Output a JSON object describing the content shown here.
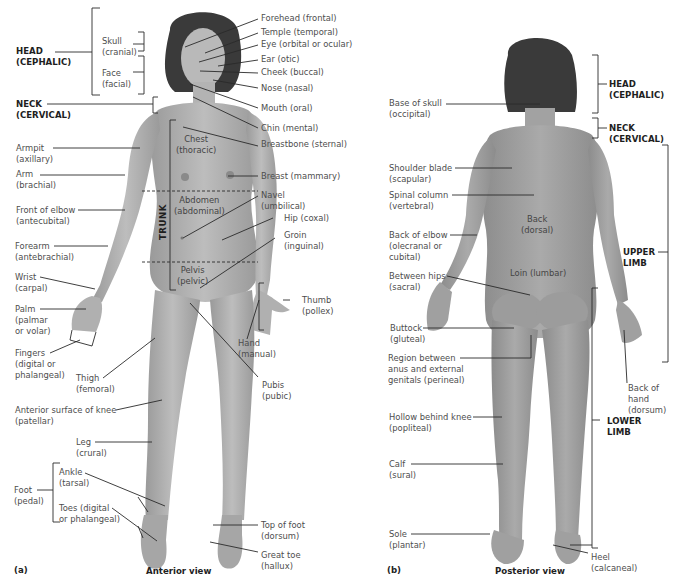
{
  "anterior": {
    "panel_label": "(a)",
    "view_title": "Anterior view",
    "regions": {
      "head": [
        "HEAD",
        "(CEPHALIC)"
      ],
      "neck": [
        "NECK",
        "(CERVICAL)"
      ],
      "trunk": "TRUNK"
    },
    "head_subparts": {
      "skull": [
        "Skull",
        "(cranial)"
      ],
      "face": [
        "Face",
        "(facial)"
      ]
    },
    "right_labels": {
      "forehead": "Forehead (frontal)",
      "temple": "Temple (temporal)",
      "eye": "Eye (orbital or ocular)",
      "ear": "Ear (otic)",
      "cheek": "Cheek (buccal)",
      "nose": "Nose (nasal)",
      "mouth": "Mouth (oral)",
      "chin": "Chin (mental)",
      "breastbone": "Breastbone (sternal)",
      "breast": "Breast (mammary)",
      "navel": [
        "Navel",
        "(umbilical)"
      ],
      "hip": "Hip (coxal)",
      "groin": [
        "Groin",
        "(inguinal)"
      ],
      "thumb": [
        "Thumb",
        "(pollex)"
      ],
      "hand": [
        "Hand",
        "(manual)"
      ],
      "pubis": [
        "Pubis",
        "(pubic)"
      ],
      "top_of_foot": [
        "Top of foot",
        "(dorsum)"
      ],
      "great_toe": [
        "Great toe",
        "(hallux)"
      ]
    },
    "left_labels": {
      "armpit": [
        "Armpit",
        "(axillary)"
      ],
      "arm": [
        "Arm",
        "(brachial)"
      ],
      "front_of_elbow": [
        "Front of elbow",
        "(antecubital)"
      ],
      "forearm": [
        "Forearm",
        "(antebrachial)"
      ],
      "wrist": [
        "Wrist",
        "(carpal)"
      ],
      "palm": [
        "Palm",
        "(palmar",
        "or volar)"
      ],
      "fingers": [
        "Fingers",
        "(digital or",
        "phalangeal)"
      ],
      "thigh": [
        "Thigh",
        "(femoral)"
      ],
      "knee": [
        "Anterior surface of knee",
        "(patellar)"
      ],
      "leg": [
        "Leg",
        "(crural)"
      ],
      "foot": [
        "Foot",
        "(pedal)"
      ],
      "ankle": [
        "Ankle",
        "(tarsal)"
      ],
      "toes": [
        "Toes (digital",
        "or phalangeal)"
      ]
    },
    "in_body_labels": {
      "chest": [
        "Chest",
        "(thoracic)"
      ],
      "abdomen": [
        "Abdomen",
        "(abdominal)"
      ],
      "pelvis": [
        "Pelvis",
        "(pelvic)"
      ]
    }
  },
  "posterior": {
    "panel_label": "(b)",
    "view_title": "Posterior view",
    "regions": {
      "head": [
        "HEAD",
        "(CEPHALIC)"
      ],
      "neck": [
        "NECK",
        "(CERVICAL)"
      ],
      "upper_limb": [
        "UPPER",
        "LIMB"
      ],
      "lower_limb": [
        "LOWER",
        "LIMB"
      ]
    },
    "left_labels": {
      "base_of_skull": [
        "Base of skull",
        "(occipital)"
      ],
      "shoulder_blade": [
        "Shoulder blade",
        "(scapular)"
      ],
      "spinal_column": [
        "Spinal column",
        "(vertebral)"
      ],
      "back_of_elbow": [
        "Back of elbow",
        "(olecranal or",
        "cubital)"
      ],
      "between_hips": [
        "Between hips",
        "(sacral)"
      ],
      "buttock": [
        "Buttock",
        "(gluteal)"
      ],
      "perineal": [
        "Region between",
        "anus and external",
        "genitals (perineal)"
      ],
      "hollow_behind_knee": [
        "Hollow behind knee",
        "(popliteal)"
      ],
      "calf": [
        "Calf",
        "(sural)"
      ],
      "sole": [
        "Sole",
        "(plantar)"
      ]
    },
    "right_labels": {
      "back_of_hand": [
        "Back of",
        "hand",
        "(dorsum)"
      ],
      "heel": [
        "Heel",
        "(calcaneal)"
      ]
    },
    "in_body_labels": {
      "back": [
        "Back",
        "(dorsal)"
      ],
      "loin": "Loin (lumbar)"
    }
  },
  "colors": {
    "skin": "#a8a8a8",
    "skin_light": "#c4c4c4",
    "hair": "#3a3a3a",
    "leader_line": "#2a2a2a",
    "label_text": "#4d4d4d",
    "region_text": "#1e1e1e"
  }
}
